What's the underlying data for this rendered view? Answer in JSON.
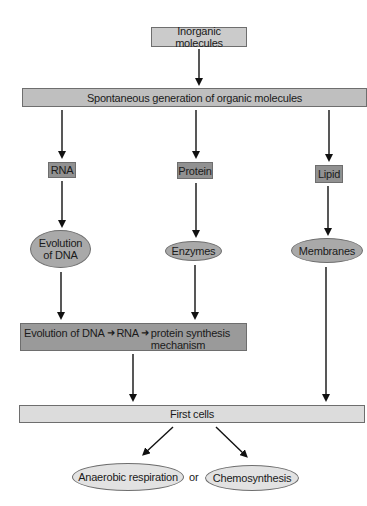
{
  "diagram": {
    "type": "flowchart",
    "colors": {
      "light_box": "#cbcbcb",
      "bar": "#bfbfbf",
      "dark_box": "#919191",
      "ellipse": "#a9a9a9",
      "pale_bar": "#dcdcdc",
      "pale_ellipse": "#e2e2e2",
      "arrow": "#111111"
    },
    "nodes": {
      "inorganic": "Inorganic molecules",
      "spontaneous": "Spontaneous generation of organic molecules",
      "rna": "RNA",
      "protein": "Protein",
      "lipid": "Lipid",
      "evolution_dna_line1": "Evolution",
      "evolution_dna_line2": "of DNA",
      "enzymes": "Enzymes",
      "membranes": "Membranes",
      "mechanism_part1": "Evolution of DNA",
      "mechanism_part2": "RNA",
      "mechanism_part3_line1": "protein synthesis",
      "mechanism_part3_line2": "mechanism",
      "first_cells": "First cells",
      "anaerobic": "Anaerobic respiration",
      "or": "or",
      "chemosynthesis": "Chemosynthesis"
    },
    "edges": [
      [
        "Inorganic molecules",
        "Spontaneous generation of organic molecules"
      ],
      [
        "Spontaneous generation of organic molecules",
        "RNA"
      ],
      [
        "Spontaneous generation of organic molecules",
        "Protein"
      ],
      [
        "Spontaneous generation of organic molecules",
        "Lipid"
      ],
      [
        "RNA",
        "Evolution of DNA"
      ],
      [
        "Protein",
        "Enzymes"
      ],
      [
        "Lipid",
        "Membranes"
      ],
      [
        "Evolution of DNA",
        "Evolution of DNA → RNA → protein synthesis mechanism"
      ],
      [
        "Enzymes",
        "Evolution of DNA → RNA → protein synthesis mechanism"
      ],
      [
        "Membranes",
        "First cells"
      ],
      [
        "Evolution of DNA → RNA → protein synthesis mechanism",
        "First cells"
      ],
      [
        "First cells",
        "Anaerobic respiration"
      ],
      [
        "First cells",
        "Chemosynthesis"
      ]
    ]
  }
}
